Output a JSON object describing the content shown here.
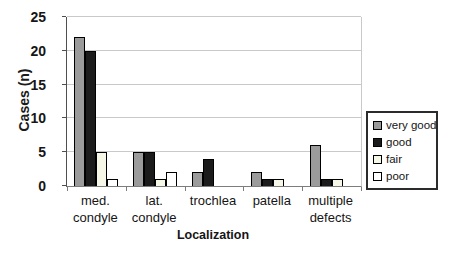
{
  "chart_data": {
    "type": "bar",
    "title": "",
    "xlabel": "Localization",
    "ylabel": "Cases (n)",
    "ylim": [
      0,
      25
    ],
    "yticks": [
      0,
      5,
      10,
      15,
      20,
      25
    ],
    "grid": true,
    "legend_position": "right",
    "categories": [
      "med. condyle",
      "lat. condyle",
      "trochlea",
      "patella",
      "multiple defects"
    ],
    "category_label_lines": [
      [
        "med.",
        "condyle"
      ],
      [
        "lat.",
        "condyle"
      ],
      [
        "trochlea"
      ],
      [
        "patella"
      ],
      [
        "multiple",
        "defects"
      ]
    ],
    "series": [
      {
        "name": "very good",
        "color": "#9b9b9b",
        "values": [
          22,
          5,
          2,
          2,
          6
        ]
      },
      {
        "name": "good",
        "color": "#1b1b1b",
        "values": [
          20,
          5,
          4,
          1,
          1
        ]
      },
      {
        "name": "fair",
        "color": "#f7f7e8",
        "values": [
          5,
          1,
          0,
          1,
          1
        ]
      },
      {
        "name": "poor",
        "color": "#ffffff",
        "values": [
          1,
          2,
          0,
          0,
          0
        ]
      }
    ],
    "colors": {
      "gridline": "#c9c9c9",
      "axis": "#4f4f4f",
      "bar_border": "#000000",
      "legend_border": "#2b2b2b"
    }
  }
}
